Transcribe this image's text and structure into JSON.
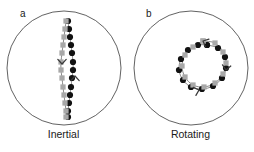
{
  "figure": {
    "width": 254,
    "height": 152,
    "background": "#ffffff"
  },
  "style": {
    "domain_outline_color": "#3a3a3a",
    "domain_fill": "#ffffff",
    "black_series_color": "#111111",
    "gray_series_color": "#a8a8a8",
    "path_line_color": "#555555",
    "text_color": "#1a1a1a"
  },
  "panels": [
    {
      "id": "a",
      "letter": "a",
      "caption": "Inertial",
      "circle": {
        "cx": 64,
        "cy": 68,
        "r": 57
      },
      "series": [
        {
          "name": "black-trajectory",
          "color": "#111111",
          "marker": "circle",
          "marker_size": 3.1,
          "arrow_label": "up",
          "points": [
            [
              68,
              21
            ],
            [
              69,
              29
            ],
            [
              70,
              37
            ],
            [
              71,
              45
            ],
            [
              72,
              53
            ],
            [
              73,
              62
            ],
            [
              73,
              70
            ],
            [
              72,
              78
            ],
            [
              71,
              87
            ],
            [
              70,
              95
            ],
            [
              69,
              103
            ],
            [
              68,
              111
            ],
            [
              68,
              117
            ]
          ]
        },
        {
          "name": "gray-trajectory",
          "color": "#a8a8a8",
          "marker": "square",
          "marker_size": 3.0,
          "arrow_label": "down",
          "points": [
            [
              66,
              21
            ],
            [
              65,
              29
            ],
            [
              64,
              37
            ],
            [
              63,
              45
            ],
            [
              62,
              53
            ],
            [
              61,
              62
            ],
            [
              61,
              70
            ],
            [
              62,
              78
            ],
            [
              63,
              87
            ],
            [
              64,
              95
            ],
            [
              65,
              103
            ],
            [
              66,
              111
            ],
            [
              66,
              117
            ]
          ]
        }
      ],
      "arrows": [
        {
          "name": "gray-direction-arrow",
          "x": 62,
          "y": 64,
          "direction": "down",
          "color": "#3a3a3a"
        },
        {
          "name": "black-direction-arrow",
          "x": 75,
          "y": 76,
          "direction": "up",
          "color": "#3a3a3a"
        }
      ]
    },
    {
      "id": "b",
      "letter": "b",
      "caption": "Rotating",
      "circle": {
        "cx": 64,
        "cy": 68,
        "r": 57
      },
      "series": [
        {
          "name": "black-trajectory",
          "color": "#111111",
          "marker": "circle",
          "marker_size": 3.1,
          "arrow_label": "clockwise",
          "points": [
            [
              80,
              45
            ],
            [
              91,
              48
            ],
            [
              98,
              57
            ],
            [
              99,
              68
            ],
            [
              95,
              78
            ],
            [
              86,
              86
            ],
            [
              75,
              89
            ],
            [
              64,
              87
            ],
            [
              56,
              80
            ],
            [
              52,
              70
            ],
            [
              54,
              59
            ],
            [
              61,
              50
            ],
            [
              71,
              45
            ],
            [
              80,
              45
            ]
          ]
        },
        {
          "name": "gray-trajectory",
          "color": "#a8a8a8",
          "marker": "square",
          "marker_size": 3.0,
          "arrow_label": "clockwise",
          "points": [
            [
              76,
              41
            ],
            [
              88,
              43
            ],
            [
              96,
              52
            ],
            [
              99,
              63
            ],
            [
              96,
              74
            ],
            [
              88,
              83
            ],
            [
              77,
              87
            ],
            [
              66,
              85
            ],
            [
              58,
              77
            ],
            [
              55,
              66
            ],
            [
              58,
              55
            ],
            [
              66,
              47
            ],
            [
              76,
              41
            ]
          ]
        }
      ],
      "arrows": [
        {
          "name": "top-direction-arrow",
          "x": 76,
          "y": 41,
          "direction": "clockwise-top",
          "color": "#3a3a3a"
        },
        {
          "name": "right-direction-arrow",
          "x": 99,
          "y": 70,
          "direction": "clockwise-right",
          "color": "#3a3a3a"
        },
        {
          "name": "bottom-direction-arrow",
          "x": 72,
          "y": 90,
          "direction": "clockwise-bottom",
          "color": "#3a3a3a"
        }
      ]
    }
  ]
}
